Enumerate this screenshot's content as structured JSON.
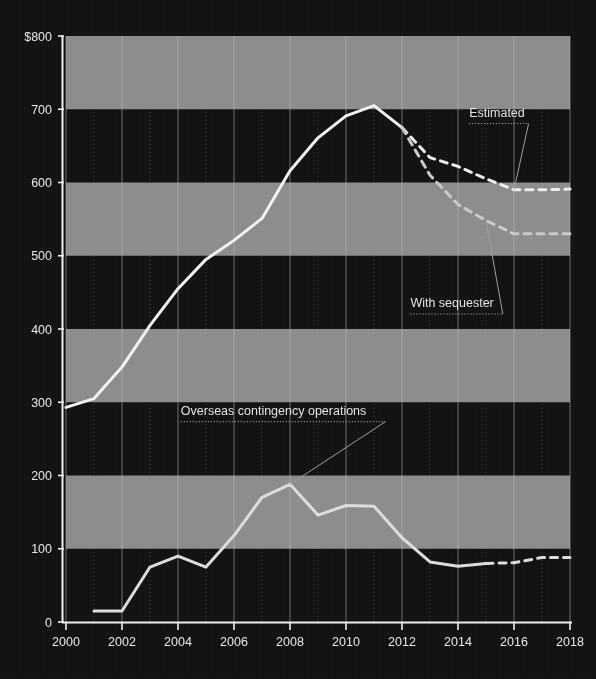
{
  "chart_data": {
    "type": "line",
    "title": "",
    "subtitle": "",
    "xlabel": "",
    "ylabel": "",
    "xlim": [
      2000,
      2018
    ],
    "ylim": [
      0,
      800
    ],
    "grid": true,
    "legend_position": "inline-annotations",
    "y_ticks": [
      "0",
      "100",
      "200",
      "300",
      "400",
      "500",
      "600",
      "700",
      "$800"
    ],
    "y_tick_values": [
      0,
      100,
      200,
      300,
      400,
      500,
      600,
      700,
      800
    ],
    "x_ticks": [
      "2000",
      "2002",
      "2004",
      "2006",
      "2008",
      "2010",
      "2012",
      "2014",
      "2016",
      "2018"
    ],
    "x_tick_values": [
      2000,
      2002,
      2004,
      2006,
      2008,
      2010,
      2012,
      2014,
      2016,
      2018
    ],
    "x": [
      2000,
      2001,
      2002,
      2003,
      2004,
      2005,
      2006,
      2007,
      2008,
      2009,
      2010,
      2011,
      2012,
      2013,
      2014,
      2015,
      2016,
      2017,
      2018
    ],
    "series": [
      {
        "name": "Total defense budget",
        "style": "solid",
        "color": "#f2f2f2",
        "x": [
          2000,
          2001,
          2002,
          2003,
          2004,
          2005,
          2006,
          2007,
          2008,
          2009,
          2010,
          2011,
          2012
        ],
        "values": [
          293,
          305,
          348,
          405,
          455,
          495,
          521,
          551,
          616,
          661,
          691,
          705,
          675
        ]
      },
      {
        "name": "Estimated",
        "style": "dashed",
        "color": "#ededed",
        "x": [
          2012,
          2013,
          2014,
          2015,
          2016,
          2017,
          2018
        ],
        "values": [
          675,
          634,
          622,
          605,
          590,
          590,
          591
        ]
      },
      {
        "name": "With sequester",
        "style": "dashed",
        "color": "#c9c9c9",
        "x": [
          2012,
          2013,
          2014,
          2015,
          2016,
          2017,
          2018
        ],
        "values": [
          675,
          610,
          570,
          548,
          530,
          530,
          530
        ]
      },
      {
        "name": "Overseas contingency operations",
        "style": "solid",
        "color": "#dcdcdc",
        "x": [
          2001,
          2002,
          2003,
          2004,
          2005,
          2006,
          2007,
          2008,
          2009,
          2010,
          2011,
          2012,
          2013,
          2014,
          2015
        ],
        "values": [
          15,
          15,
          75,
          90,
          75,
          118,
          170,
          188,
          146,
          159,
          158,
          115,
          82,
          76,
          80
        ]
      },
      {
        "name": "Overseas contingency operations projected",
        "style": "dashed",
        "color": "#dcdcdc",
        "x": [
          2015,
          2016,
          2017,
          2018
        ],
        "values": [
          80,
          81,
          88,
          88
        ]
      }
    ],
    "annotations": [
      {
        "label": "Estimated",
        "x": 2016,
        "y": 590,
        "text_x": 2014.4,
        "text_y": 690
      },
      {
        "label": "With sequester",
        "x": 2015,
        "y": 548,
        "text_x": 2012.3,
        "text_y": 430
      },
      {
        "label": "Overseas contingency operations",
        "x": 2008,
        "y": 188,
        "text_x": 2004.1,
        "text_y": 283
      }
    ],
    "bands": {
      "description": "alternating horizontal bands every 100 units",
      "light_color": "#8c8c8c",
      "dark_color": "#151515",
      "light_ranges": [
        [
          700,
          800
        ],
        [
          500,
          600
        ],
        [
          300,
          400
        ],
        [
          100,
          200
        ]
      ]
    },
    "background_color": "#111111",
    "axis_color": "#f0f0f0",
    "gridline_color": "#b9b9b9"
  }
}
